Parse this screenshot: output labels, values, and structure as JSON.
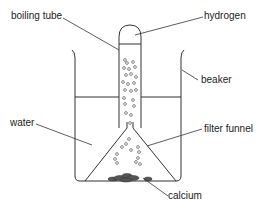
{
  "diagram": {
    "type": "apparatus",
    "labels": {
      "boiling_tube": "boiling tube",
      "hydrogen": "hydrogen",
      "beaker": "beaker",
      "water": "water",
      "filter_funnel": "filter funnel",
      "calcium": "calcium"
    },
    "colors": {
      "line": "#333333",
      "calcium": "#555555",
      "background": "#ffffff"
    }
  }
}
